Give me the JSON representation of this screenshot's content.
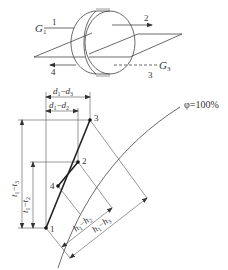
{
  "wheel": {
    "labels": {
      "g1": "G",
      "g1_sub": "1",
      "g3": "G",
      "g3_sub": "3",
      "stream1": "1",
      "stream2": "2",
      "stream3": "3",
      "stream4": "4"
    }
  },
  "chart": {
    "points": [
      {
        "id": "p1",
        "label": "1"
      },
      {
        "id": "p2",
        "label": "2"
      },
      {
        "id": "p3",
        "label": "3"
      },
      {
        "id": "p4",
        "label": "4"
      }
    ],
    "dims": {
      "d13_a": "d",
      "d13_a_sub": "1",
      "d13_sep": "−",
      "d13_b": "d",
      "d13_b_sub": "3",
      "d12_a": "d",
      "d12_a_sub": "1",
      "d12_sep": "−",
      "d12_b": "d",
      "d12_b_sub": "2",
      "t13_a": "t",
      "t13_a_sub": "1",
      "t13_sep": "−",
      "t13_b": "t",
      "t13_b_sub": "3",
      "t12_a": "t",
      "t12_a_sub": "1",
      "t12_sep": "−",
      "t12_b": "t",
      "t12_b_sub": "2",
      "h12_a": "h",
      "h12_a_sub": "1",
      "h12_sep": "−",
      "h12_b": "h",
      "h12_b_sub": "2",
      "h13_a": "h",
      "h13_a_sub": "1",
      "h13_sep": "−",
      "h13_b": "h",
      "h13_b_sub": "3"
    },
    "curve_label": "φ=100%"
  }
}
